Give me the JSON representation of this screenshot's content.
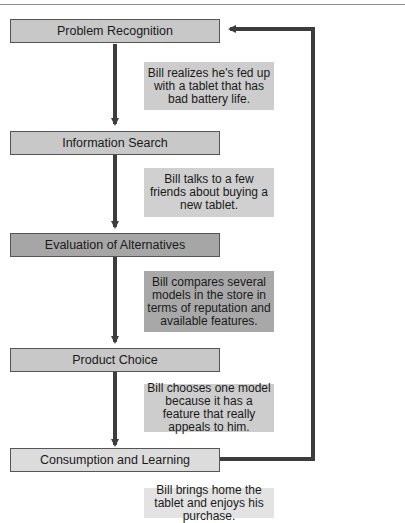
{
  "diagram": {
    "stages": [
      {
        "label": "Problem Recognition",
        "fill": "#c8c8c8"
      },
      {
        "label": "Information Search",
        "fill": "#c8c8c8"
      },
      {
        "label": "Evaluation of Alternatives",
        "fill": "#a6a6a6"
      },
      {
        "label": "Product Choice",
        "fill": "#c8c8c8"
      },
      {
        "label": "Consumption and Learning",
        "fill": "#dcdcdc"
      }
    ],
    "notes": [
      {
        "text": "Bill realizes he's fed up with a tablet that has bad battery life.",
        "fill": "#cdcdcd"
      },
      {
        "text": "Bill talks to a few friends about buying a new tablet.",
        "fill": "#d0d0d0"
      },
      {
        "text": "Bill compares several models in the store in terms of reputation and available features.",
        "fill": "#a8a8a8"
      },
      {
        "text": "Bill chooses one model because it has a feature that really appeals to him.",
        "fill": "#cdcdcd"
      },
      {
        "text": "Bill brings home the tablet and enjoys his purchase.",
        "fill": "#e3e3e3"
      }
    ],
    "feedback_loop": "Consumption and Learning returns to Problem Recognition"
  }
}
